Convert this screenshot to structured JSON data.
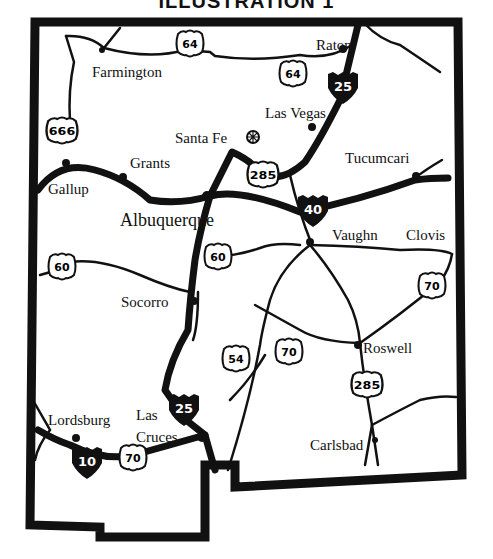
{
  "title": "ILLUSTRATION 1",
  "map": {
    "region": "New Mexico",
    "cities": [
      {
        "name": "Raton",
        "x": 316,
        "y": 50
      },
      {
        "name": "Farmington",
        "x": 92,
        "y": 77
      },
      {
        "name": "Las Vegas",
        "x": 265,
        "y": 118
      },
      {
        "name": "Santa Fe",
        "x": 175,
        "y": 143
      },
      {
        "name": "Grants",
        "x": 130,
        "y": 168
      },
      {
        "name": "Tucumcari",
        "x": 345,
        "y": 163
      },
      {
        "name": "Gallup",
        "x": 48,
        "y": 194
      },
      {
        "name": "Albuquerque",
        "x": 120,
        "y": 226
      },
      {
        "name": "Vaughn",
        "x": 332,
        "y": 240
      },
      {
        "name": "Clovis",
        "x": 406,
        "y": 240
      },
      {
        "name": "Socorro",
        "x": 121,
        "y": 307
      },
      {
        "name": "Roswell",
        "x": 363,
        "y": 353
      },
      {
        "name": "Lordsburg",
        "x": 48,
        "y": 425
      },
      {
        "name": "Las",
        "x": 136,
        "y": 420
      },
      {
        "name": "Cruces",
        "x": 136,
        "y": 442
      },
      {
        "name": "Carlsbad",
        "x": 310,
        "y": 450
      }
    ],
    "us_routes": [
      {
        "label": "64",
        "x": 190,
        "y": 44
      },
      {
        "label": "64",
        "x": 293,
        "y": 74
      },
      {
        "label": "666",
        "x": 62,
        "y": 131
      },
      {
        "label": "285",
        "x": 263,
        "y": 175
      },
      {
        "label": "60",
        "x": 62,
        "y": 267
      },
      {
        "label": "60",
        "x": 218,
        "y": 257
      },
      {
        "label": "70",
        "x": 432,
        "y": 286
      },
      {
        "label": "54",
        "x": 236,
        "y": 359
      },
      {
        "label": "70",
        "x": 289,
        "y": 352
      },
      {
        "label": "285",
        "x": 367,
        "y": 385
      },
      {
        "label": "70",
        "x": 133,
        "y": 458
      }
    ],
    "interstates": [
      {
        "label": "25",
        "x": 343,
        "y": 86
      },
      {
        "label": "40",
        "x": 313,
        "y": 209
      },
      {
        "label": "25",
        "x": 184,
        "y": 408
      },
      {
        "label": "10",
        "x": 87,
        "y": 461
      }
    ],
    "colors": {
      "ink": "#111111",
      "background": "#ffffff"
    }
  }
}
